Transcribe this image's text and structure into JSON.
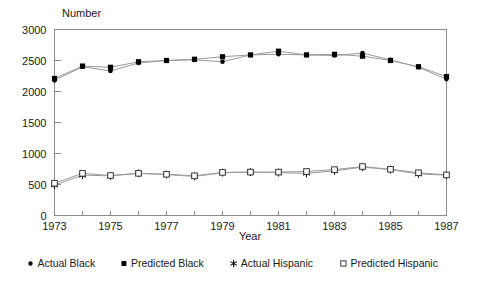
{
  "chart_data": {
    "type": "line",
    "title": "",
    "ylabel": "Number",
    "xlabel": "Year",
    "grid": false,
    "legend_position": "bottom",
    "x": [
      1973,
      1974,
      1975,
      1976,
      1977,
      1978,
      1979,
      1980,
      1981,
      1982,
      1983,
      1984,
      1985,
      1986,
      1987
    ],
    "xlim": [
      1973,
      1987
    ],
    "ylim": [
      0,
      3000
    ],
    "ytick_labels": [
      "0",
      "500",
      "1000",
      "1500",
      "2000",
      "2500",
      "3000"
    ],
    "yticks": [
      0,
      500,
      1000,
      1500,
      2000,
      2500,
      3000
    ],
    "xtick_labels": [
      "1973",
      "1975",
      "1977",
      "1979",
      "1981",
      "1983",
      "1985",
      "1987"
    ],
    "xticks": [
      1973,
      1975,
      1977,
      1979,
      1981,
      1983,
      1985,
      1987
    ],
    "xminor_ticks": [
      1974,
      1976,
      1978,
      1980,
      1982,
      1984,
      1986
    ],
    "series": [
      {
        "name": "Actual Black",
        "marker": "filled-circle",
        "color": "#000000",
        "values": [
          2180,
          2400,
          2330,
          2460,
          2500,
          2510,
          2480,
          2590,
          2600,
          2590,
          2580,
          2620,
          2510,
          2390,
          2200
        ]
      },
      {
        "name": "Predicted Black",
        "marker": "filled-square",
        "color": "#000000",
        "values": [
          2210,
          2410,
          2390,
          2480,
          2500,
          2520,
          2560,
          2590,
          2650,
          2590,
          2600,
          2570,
          2500,
          2400,
          2240
        ]
      },
      {
        "name": "Actual Hispanic",
        "marker": "star",
        "color": "#000000",
        "values": [
          490,
          650,
          640,
          680,
          660,
          630,
          690,
          700,
          690,
          680,
          720,
          780,
          740,
          670,
          650
        ]
      },
      {
        "name": "Predicted Hispanic",
        "marker": "open-square",
        "color": "#000000",
        "values": [
          520,
          680,
          645,
          680,
          665,
          640,
          695,
          700,
          700,
          710,
          740,
          790,
          745,
          690,
          655
        ]
      }
    ]
  },
  "legend": {
    "items": [
      {
        "label": "Actual Black",
        "marker": "filled-circle"
      },
      {
        "label": "Predicted Black",
        "marker": "filled-square"
      },
      {
        "label": "Actual Hispanic",
        "marker": "star"
      },
      {
        "label": "Predicted Hispanic",
        "marker": "open-square"
      }
    ]
  }
}
